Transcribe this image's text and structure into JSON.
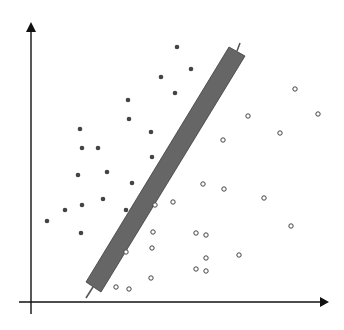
{
  "diagram": {
    "type": "svm-separating-margin",
    "width": 344,
    "height": 330,
    "colors": {
      "background": "#ffffff",
      "axis": "#111111",
      "band_fill": "#666666",
      "band_stroke": "#3c3c3c",
      "stub": "#555555",
      "filled_point": "#444444",
      "open_point_stroke": "#444444",
      "open_point_fill": "#ffffff"
    },
    "axes": {
      "origin": [
        31,
        302
      ],
      "x_axis": {
        "from": [
          19,
          302
        ],
        "to": [
          329,
          302
        ]
      },
      "y_axis": {
        "from": [
          31,
          314
        ],
        "to": [
          31,
          22
        ]
      }
    },
    "band": {
      "corners": [
        [
          229,
          47
        ],
        [
          245,
          56
        ],
        [
          101,
          292
        ],
        [
          86,
          282
        ]
      ],
      "top_stub": {
        "from": [
          237,
          51
        ],
        "to": [
          240,
          43
        ]
      },
      "bottom_stub": {
        "from": [
          93,
          287
        ],
        "to": [
          86,
          298
        ]
      }
    },
    "class_filled": {
      "label": "filled points",
      "radius": 2.3,
      "points": [
        [
          177,
          47
        ],
        [
          191,
          69
        ],
        [
          161,
          77
        ],
        [
          175,
          93
        ],
        [
          128,
          100
        ],
        [
          129,
          119
        ],
        [
          80,
          129
        ],
        [
          151,
          132
        ],
        [
          82,
          148
        ],
        [
          98,
          148
        ],
        [
          152,
          157
        ],
        [
          107,
          172
        ],
        [
          78,
          175
        ],
        [
          132,
          183
        ],
        [
          103,
          199
        ],
        [
          82,
          205
        ],
        [
          65,
          210
        ],
        [
          126,
          210
        ],
        [
          47,
          221
        ],
        [
          81,
          233
        ]
      ]
    },
    "class_open": {
      "label": "open points",
      "radius": 2.2,
      "points": [
        [
          295,
          89
        ],
        [
          318,
          114
        ],
        [
          248,
          116
        ],
        [
          280,
          133
        ],
        [
          223,
          140
        ],
        [
          203,
          184
        ],
        [
          224,
          189
        ],
        [
          264,
          198
        ],
        [
          173,
          202
        ],
        [
          155,
          205
        ],
        [
          291,
          226
        ],
        [
          153,
          232
        ],
        [
          196,
          233
        ],
        [
          206,
          235
        ],
        [
          152,
          248
        ],
        [
          126,
          252
        ],
        [
          239,
          255
        ],
        [
          206,
          258
        ],
        [
          196,
          269
        ],
        [
          206,
          271
        ],
        [
          151,
          278
        ],
        [
          116,
          287
        ],
        [
          129,
          289
        ]
      ]
    }
  }
}
